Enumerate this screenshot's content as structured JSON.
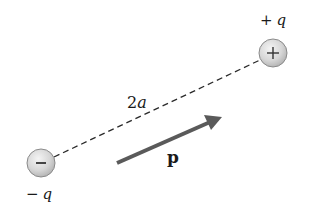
{
  "diagram": {
    "colors": {
      "background": "#ffffff",
      "charge_fill_light": "#f2f2f2",
      "charge_fill_dark": "#b8b8b8",
      "charge_stroke": "#8a8a8a",
      "dash_line": "#2a2a2a",
      "arrow": "#5a5a5a",
      "text": "#1a1a1a"
    },
    "charges": [
      {
        "id": "positive",
        "symbol": "+",
        "label_sign": "+",
        "label_var": "q",
        "cx": 273,
        "cy": 53,
        "r": 14
      },
      {
        "id": "negative",
        "symbol": "−",
        "label_sign": "−",
        "label_var": "q",
        "cx": 41,
        "cy": 163,
        "r": 14
      }
    ],
    "separation": {
      "label_num": "2",
      "label_var": "a"
    },
    "dipole_moment": {
      "label": "p",
      "x1": 117,
      "y1": 163,
      "x2": 221,
      "y2": 117
    }
  }
}
